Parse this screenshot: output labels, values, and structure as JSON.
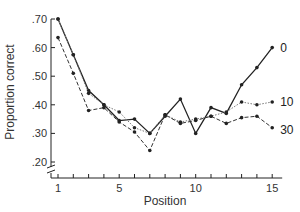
{
  "chart_data": {
    "type": "line",
    "title": "",
    "xlabel": "Position",
    "ylabel": "Proportion correct",
    "x": [
      1,
      2,
      3,
      4,
      5,
      6,
      7,
      8,
      9,
      10,
      11,
      12,
      13,
      14,
      15
    ],
    "x_tick_labels": [
      "1",
      "5",
      "10",
      "15"
    ],
    "x_tick_values": [
      1,
      5,
      10,
      15
    ],
    "y_tick_labels": [
      ".70",
      ".60",
      ".50",
      ".40",
      ".30",
      ".20"
    ],
    "y_tick_values": [
      0.7,
      0.6,
      0.5,
      0.4,
      0.3,
      0.2
    ],
    "ylim": [
      0.2,
      0.7
    ],
    "xlim": [
      1,
      15
    ],
    "grid": false,
    "legend_position": "inline-right",
    "axis_break": "y-axis below .20",
    "series": [
      {
        "name": "0",
        "style": "solid",
        "color": "#222222",
        "values": [
          0.7,
          0.575,
          0.45,
          0.4,
          0.345,
          0.35,
          0.3,
          0.36,
          0.42,
          0.3,
          0.39,
          0.37,
          0.47,
          0.53,
          0.6
        ]
      },
      {
        "name": "10",
        "style": "dotted",
        "color": "#777777",
        "values": [
          0.7,
          0.575,
          0.44,
          0.4,
          0.375,
          0.32,
          0.3,
          0.365,
          0.34,
          0.35,
          0.36,
          0.375,
          0.41,
          0.4,
          0.41
        ]
      },
      {
        "name": "30",
        "style": "dashed",
        "color": "#333333",
        "values": [
          0.635,
          0.51,
          0.38,
          0.39,
          0.34,
          0.305,
          0.24,
          0.365,
          0.335,
          0.345,
          0.36,
          0.335,
          0.355,
          0.36,
          0.32
        ]
      }
    ]
  }
}
